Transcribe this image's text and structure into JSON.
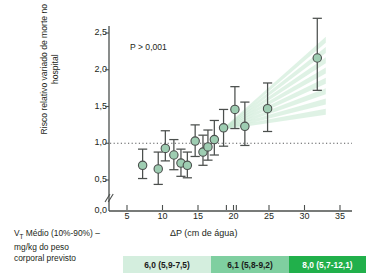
{
  "chart_data": {
    "type": "scatter",
    "title": "",
    "xlabel": "ΔP (cm de água)",
    "ylabel": "Risco relativo variado de morte no hospital",
    "annotation": "P > 0,001",
    "xlim": [
      3.5,
      36.5
    ],
    "ylim": [
      0.35,
      2.72
    ],
    "xticks": [
      5,
      10,
      15,
      20,
      25,
      30,
      35
    ],
    "xtick_labels": [
      "5",
      "10",
      "15",
      "20",
      "25",
      "30",
      "35"
    ],
    "extra_xticks": [
      19,
      20.4
    ],
    "yticks": [
      0.0,
      0.5,
      1.0,
      1.5,
      2.0,
      2.5
    ],
    "ytick_labels": [
      "0,0",
      "0,5",
      "1,0",
      "1,5",
      "2,0",
      "2,5"
    ],
    "axis_break": true,
    "reference_line": {
      "y": 1.0,
      "style": "dotted"
    },
    "grid": false,
    "legend_position": "none",
    "marker_face_color": "#9ecdb2",
    "marker_edge_color": "#4b4f4d",
    "errorbar_color": "#4b4f4d",
    "band_color": "#b9e2c6",
    "points": [
      {
        "x": 7.2,
        "y": 0.7,
        "lo": 0.52,
        "hi": 0.92
      },
      {
        "x": 9.4,
        "y": 0.65,
        "lo": 0.44,
        "hi": 0.88
      },
      {
        "x": 10.4,
        "y": 0.93,
        "lo": 0.76,
        "hi": 1.17
      },
      {
        "x": 11.6,
        "y": 0.84,
        "lo": 0.64,
        "hi": 1.05
      },
      {
        "x": 12.6,
        "y": 0.73,
        "lo": 0.55,
        "hi": 0.92
      },
      {
        "x": 13.5,
        "y": 0.7,
        "lo": 0.53,
        "hi": 0.88
      },
      {
        "x": 14.6,
        "y": 1.03,
        "lo": 0.82,
        "hi": 1.25
      },
      {
        "x": 15.7,
        "y": 0.88,
        "lo": 0.7,
        "hi": 1.11
      },
      {
        "x": 16.4,
        "y": 0.95,
        "lo": 0.77,
        "hi": 1.18
      },
      {
        "x": 17.3,
        "y": 1.05,
        "lo": 0.84,
        "hi": 1.31
      },
      {
        "x": 18.6,
        "y": 1.21,
        "lo": 0.96,
        "hi": 1.46
      },
      {
        "x": 20.2,
        "y": 1.46,
        "lo": 1.2,
        "hi": 1.77
      },
      {
        "x": 21.6,
        "y": 1.23,
        "lo": 0.97,
        "hi": 1.56
      },
      {
        "x": 24.8,
        "y": 1.47,
        "lo": 1.16,
        "hi": 1.82
      },
      {
        "x": 31.8,
        "y": 2.16,
        "lo": 1.72,
        "hi": 2.7
      }
    ],
    "band": {
      "x_start": 18.6,
      "x_end": 33.0,
      "y_start": 1.21,
      "y_upper_end": 2.45,
      "y_lower_end": 1.47,
      "rays": 7
    }
  },
  "legend": {
    "caption_line1": "V",
    "caption_sub": "T",
    "caption_line1_rest": " Médio (10%-90%) –",
    "caption_line2": "mg/kg do peso",
    "caption_line3": "corporal previsto",
    "segments": [
      {
        "label": "6,0 (5,9-7,5)",
        "color": "#d4eede",
        "text_color": "#1a1a1a",
        "width": 88
      },
      {
        "label": "6,1 (5,8-9,2)",
        "color": "#7fcfa0",
        "text_color": "#1a1a1a",
        "width": 78
      },
      {
        "label": "8,0 (5,7-12,1)",
        "color": "#21b04b",
        "text_color": "#ffffff",
        "width": 77
      }
    ]
  }
}
